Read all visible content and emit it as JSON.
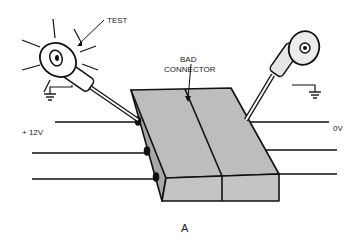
{
  "diagram": {
    "type": "electrical-test-illustration",
    "labels": {
      "test": "TEST",
      "bad_connector_line1": "BAD",
      "bad_connector_line2": "CONNECTOR",
      "plus_voltage": "+ 12V",
      "zero_voltage": "0V",
      "panel": "A"
    },
    "components": [
      {
        "id": "test-lamp-left",
        "state": "lit",
        "grounded": true
      },
      {
        "id": "test-lamp-right",
        "state": "unlit",
        "grounded": true
      },
      {
        "id": "connector-block",
        "halves": 2,
        "condition": "bad"
      },
      {
        "id": "wires-left",
        "count": 3
      },
      {
        "id": "wires-right",
        "count": 3
      }
    ],
    "colors": {
      "line": "#111111",
      "connector_fill": "#bdbdbd",
      "lamp_fill": "#e0e0e0",
      "background": "#ffffff"
    }
  }
}
